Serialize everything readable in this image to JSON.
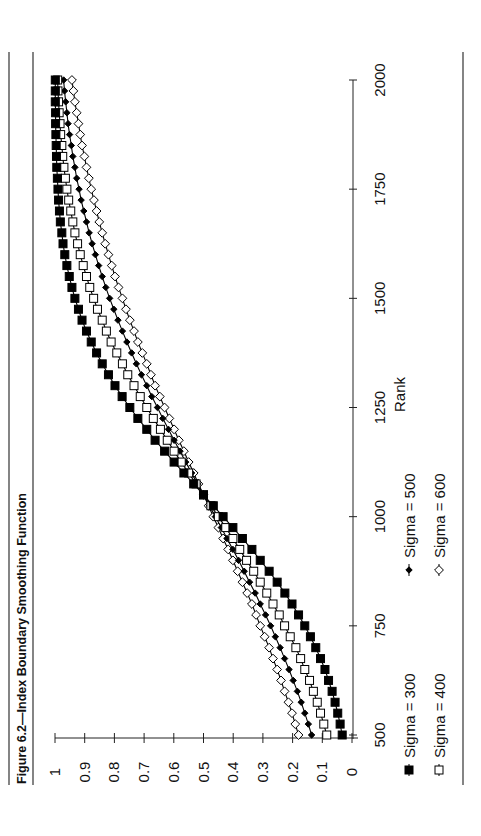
{
  "figure": {
    "title": "Figure 6.2—Index Boundary Smoothing Function",
    "orientation": "rotated 90 degrees counter-clockwise"
  },
  "chart_data": {
    "type": "line",
    "title": "Figure 6.2—Index Boundary Smoothing Function",
    "xlabel": "Rank",
    "ylabel": "",
    "xlim": [
      500,
      2000
    ],
    "ylim": [
      0,
      1
    ],
    "x_ticks": [
      "500",
      "750",
      "1000",
      "1250",
      "1500",
      "1750",
      "2000"
    ],
    "y_ticks": [
      "0",
      "0.1",
      "0.2",
      "0.3",
      "0.4",
      "0.5",
      "0.6",
      "0.7",
      "0.8",
      "0.9",
      "1"
    ],
    "grid": false,
    "legend_position": "bottom",
    "x": [
      500,
      525,
      550,
      575,
      600,
      625,
      650,
      675,
      700,
      725,
      750,
      775,
      800,
      825,
      850,
      875,
      900,
      925,
      950,
      975,
      1000,
      1025,
      1050,
      1075,
      1100,
      1125,
      1150,
      1175,
      1200,
      1225,
      1250,
      1275,
      1300,
      1325,
      1350,
      1375,
      1400,
      1425,
      1450,
      1475,
      1500,
      1525,
      1550,
      1575,
      1600,
      1625,
      1650,
      1675,
      1700,
      1725,
      1750,
      1775,
      1800,
      1825,
      1850,
      1875,
      1900,
      1925,
      1950,
      1975,
      2000
    ],
    "series": [
      {
        "name": "Sigma = 300",
        "marker": "filled-square",
        "values": [
          0.033,
          0.04,
          0.048,
          0.057,
          0.067,
          0.079,
          0.091,
          0.106,
          0.122,
          0.14,
          0.159,
          0.18,
          0.202,
          0.226,
          0.252,
          0.279,
          0.309,
          0.337,
          0.369,
          0.401,
          0.434,
          0.467,
          0.5,
          0.533,
          0.566,
          0.599,
          0.631,
          0.663,
          0.691,
          0.721,
          0.748,
          0.774,
          0.798,
          0.82,
          0.841,
          0.86,
          0.878,
          0.894,
          0.909,
          0.921,
          0.933,
          0.943,
          0.952,
          0.96,
          0.967,
          0.973,
          0.977,
          0.982,
          0.985,
          0.988,
          0.99,
          0.992,
          0.994,
          0.995,
          0.996,
          0.997,
          0.998,
          0.998,
          0.999,
          0.999,
          0.999
        ]
      },
      {
        "name": "Sigma = 400",
        "marker": "open-square",
        "values": [
          0.085,
          0.095,
          0.106,
          0.117,
          0.13,
          0.143,
          0.159,
          0.173,
          0.189,
          0.208,
          0.227,
          0.245,
          0.266,
          0.287,
          0.309,
          0.331,
          0.355,
          0.378,
          0.401,
          0.425,
          0.45,
          0.475,
          0.5,
          0.525,
          0.55,
          0.575,
          0.599,
          0.622,
          0.645,
          0.669,
          0.691,
          0.713,
          0.734,
          0.755,
          0.773,
          0.792,
          0.811,
          0.827,
          0.841,
          0.857,
          0.87,
          0.883,
          0.894,
          0.905,
          0.915,
          0.924,
          0.933,
          0.94,
          0.947,
          0.954,
          0.96,
          0.965,
          0.97,
          0.974,
          0.977,
          0.981,
          0.983,
          0.986,
          0.988,
          0.99,
          0.991
        ]
      },
      {
        "name": "Sigma = 500",
        "marker": "filled-diamond",
        "values": [
          0.136,
          0.147,
          0.159,
          0.171,
          0.184,
          0.198,
          0.212,
          0.227,
          0.242,
          0.258,
          0.274,
          0.291,
          0.309,
          0.326,
          0.345,
          0.363,
          0.382,
          0.401,
          0.421,
          0.44,
          0.46,
          0.48,
          0.5,
          0.52,
          0.54,
          0.56,
          0.579,
          0.599,
          0.618,
          0.637,
          0.655,
          0.674,
          0.691,
          0.709,
          0.726,
          0.742,
          0.758,
          0.773,
          0.788,
          0.802,
          0.816,
          0.829,
          0.841,
          0.853,
          0.864,
          0.875,
          0.885,
          0.894,
          0.903,
          0.912,
          0.919,
          0.927,
          0.933,
          0.94,
          0.945,
          0.951,
          0.956,
          0.96,
          0.964,
          0.968,
          0.971
        ]
      },
      {
        "name": "Sigma = 600",
        "marker": "open-diamond",
        "values": [
          0.18,
          0.191,
          0.202,
          0.214,
          0.227,
          0.239,
          0.252,
          0.266,
          0.279,
          0.294,
          0.309,
          0.323,
          0.337,
          0.353,
          0.369,
          0.385,
          0.401,
          0.417,
          0.434,
          0.45,
          0.467,
          0.483,
          0.5,
          0.517,
          0.533,
          0.55,
          0.566,
          0.583,
          0.599,
          0.615,
          0.631,
          0.647,
          0.663,
          0.677,
          0.691,
          0.706,
          0.721,
          0.734,
          0.748,
          0.761,
          0.773,
          0.786,
          0.798,
          0.809,
          0.82,
          0.831,
          0.841,
          0.851,
          0.86,
          0.869,
          0.878,
          0.886,
          0.894,
          0.901,
          0.909,
          0.915,
          0.921,
          0.927,
          0.933,
          0.938,
          0.943
        ]
      }
    ]
  },
  "legend": {
    "items": [
      {
        "label": "Sigma = 300",
        "marker": "filled-square"
      },
      {
        "label": "Sigma = 400",
        "marker": "open-square"
      },
      {
        "label": "Sigma = 500",
        "marker": "filled-diamond"
      },
      {
        "label": "Sigma = 600",
        "marker": "open-diamond"
      }
    ]
  },
  "colors": {
    "line": "#000000",
    "axis": "#222222",
    "background": "#ffffff"
  }
}
